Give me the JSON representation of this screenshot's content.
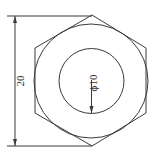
{
  "drawing": {
    "type": "hex nut top view",
    "outer_dimension_label": "20",
    "inner_diameter_label": "ϕ10",
    "colors": {
      "line": "#3a3a3a",
      "background": "#ffffff"
    }
  }
}
